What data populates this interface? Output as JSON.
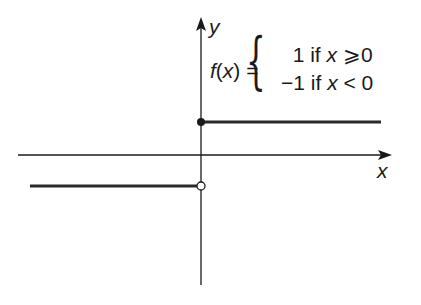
{
  "diagram": {
    "type": "step-function-graph",
    "axes": {
      "x_label": "x",
      "y_label": "y"
    },
    "formula": {
      "lhs": "f(x) =",
      "cases": [
        {
          "value": "1",
          "condition": "if",
          "var": "x",
          "op": "⩾",
          "rhs": "0"
        },
        {
          "value": "−1",
          "condition": "if",
          "var": "x",
          "op": "<",
          "rhs": "0"
        }
      ]
    },
    "segments": [
      {
        "name": "upper",
        "y": 1,
        "x_from": 0,
        "x_to": "+inf",
        "endpoint": "closed"
      },
      {
        "name": "lower",
        "y": -1,
        "x_from": "-inf",
        "x_to": 0,
        "endpoint": "open"
      }
    ],
    "colors": {
      "ink": "#1a1a1a",
      "background": "#ffffff"
    }
  }
}
